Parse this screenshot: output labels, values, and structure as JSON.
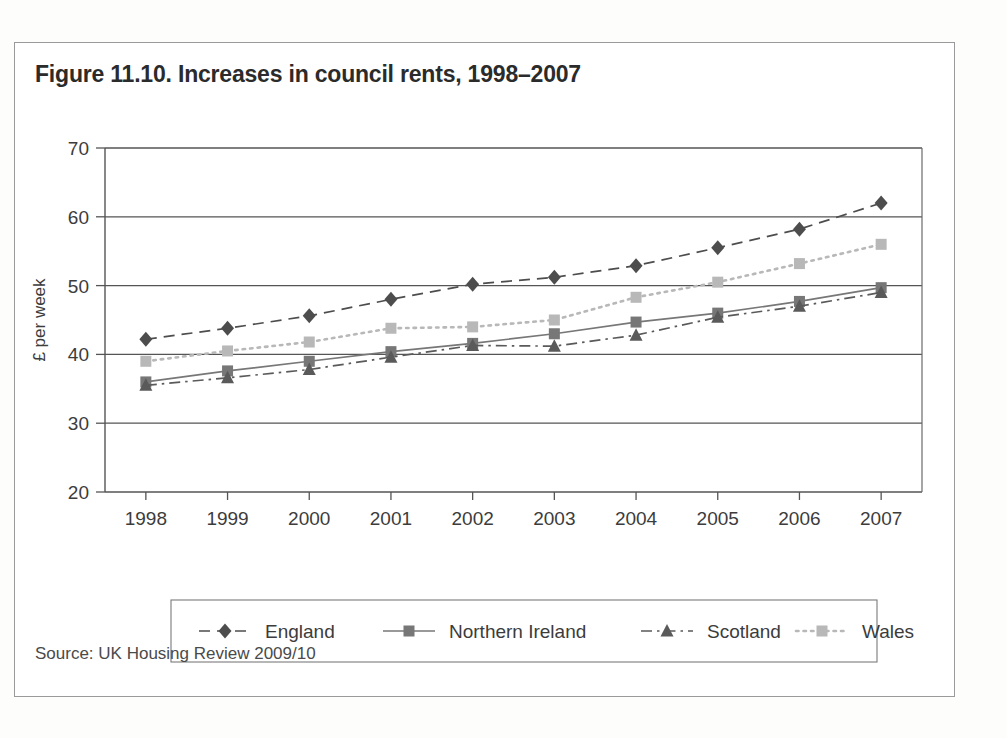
{
  "figure": {
    "title": "Figure 11.10. Increases in council rents, 1998–2007",
    "source": "Source: UK Housing Review 2009/10"
  },
  "chart_data": {
    "type": "line",
    "title": "Figure 11.10. Increases in council rents, 1998–2007",
    "xlabel": "",
    "ylabel": "£ per week",
    "categories": [
      "1998",
      "1999",
      "2000",
      "2001",
      "2002",
      "2003",
      "2004",
      "2005",
      "2006",
      "2007"
    ],
    "x": [
      1998,
      1999,
      2000,
      2001,
      2002,
      2003,
      2004,
      2005,
      2006,
      2007
    ],
    "ylim": [
      20,
      70
    ],
    "yticks": [
      20,
      30,
      40,
      50,
      60,
      70
    ],
    "grid": true,
    "legend_position": "bottom",
    "series": [
      {
        "name": "England",
        "color": "#4d4d4d",
        "line_style": "dashed",
        "marker": "diamond",
        "values": [
          42.2,
          43.8,
          45.6,
          48.0,
          50.2,
          51.2,
          52.9,
          55.5,
          58.2,
          62.0
        ]
      },
      {
        "name": "Northern Ireland",
        "color": "#777777",
        "line_style": "solid",
        "marker": "square",
        "values": [
          36.0,
          37.6,
          39.0,
          40.4,
          41.6,
          43.0,
          44.7,
          46.0,
          47.7,
          49.7
        ]
      },
      {
        "name": "Scotland",
        "color": "#5a5a5a",
        "line_style": "dash-dot",
        "marker": "triangle",
        "values": [
          35.5,
          36.6,
          37.8,
          39.6,
          41.3,
          41.2,
          42.8,
          45.4,
          47.0,
          49.0
        ]
      },
      {
        "name": "Wales",
        "color": "#b8b8b8",
        "line_style": "dotted",
        "marker": "square",
        "values": [
          39.0,
          40.5,
          41.8,
          43.8,
          44.0,
          45.0,
          48.3,
          50.5,
          53.2,
          56.0
        ]
      }
    ]
  }
}
